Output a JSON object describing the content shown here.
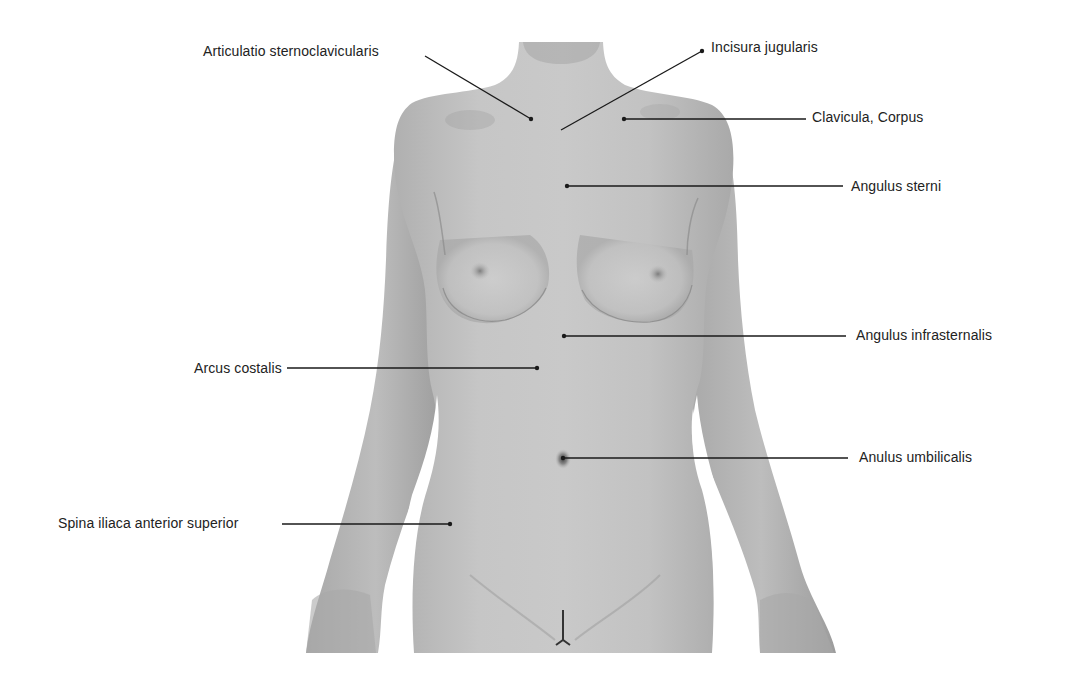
{
  "figure": {
    "type": "anatomical-surface-anatomy",
    "view": "anterior torso, female",
    "colors": {
      "background": "#ffffff",
      "skin": "#b9b9b9",
      "skin_dark": "#8f8f8f",
      "skin_light": "#cdcdcd",
      "leader": "#1a1a1a",
      "text": "#222222"
    }
  },
  "labels": [
    {
      "id": "articulatio-sternoclavicularis",
      "text": "Articulatio sternoclavicularis",
      "side": "left",
      "text_x": 203,
      "text_y": 43,
      "line": [
        425,
        56,
        531,
        119
      ]
    },
    {
      "id": "incisura-jugularis",
      "text": "Incisura jugularis",
      "side": "right",
      "text_x": 711,
      "text_y": 39,
      "line": [
        702,
        51,
        561,
        130
      ]
    },
    {
      "id": "clavicula-corpus",
      "text": "Clavicula, Corpus",
      "side": "right",
      "text_x": 812,
      "text_y": 109,
      "line": [
        624,
        119,
        806,
        119
      ]
    },
    {
      "id": "angulus-sterni",
      "text": "Angulus sterni",
      "side": "right",
      "text_x": 851,
      "text_y": 178,
      "line": [
        567,
        186,
        843,
        186
      ]
    },
    {
      "id": "angulus-infrasternalis",
      "text": "Angulus infrasternalis",
      "side": "right",
      "text_x": 856,
      "text_y": 327,
      "line": [
        564,
        336,
        846,
        336
      ]
    },
    {
      "id": "arcus-costalis",
      "text": "Arcus costalis",
      "side": "left",
      "text_x": 194,
      "text_y": 360,
      "line": [
        287,
        368,
        537,
        368
      ]
    },
    {
      "id": "anulus-umbilicalis",
      "text": "Anulus umbilicalis",
      "side": "right",
      "text_x": 859,
      "text_y": 449,
      "line": [
        563,
        458,
        848,
        458
      ]
    },
    {
      "id": "spina-iliaca-anterior-superior",
      "text": "Spina iliaca anterior superior",
      "side": "left",
      "text_x": 58,
      "text_y": 515,
      "line": [
        282,
        524,
        450,
        524
      ]
    }
  ]
}
